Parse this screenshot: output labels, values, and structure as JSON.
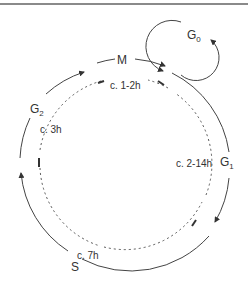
{
  "phases": {
    "m": {
      "label": "M"
    },
    "g1": {
      "label": "G",
      "sub": "1"
    },
    "s": {
      "label": "S"
    },
    "g2": {
      "label": "G",
      "sub": "2"
    },
    "g0": {
      "label": "G",
      "sub": "0"
    }
  },
  "durations": {
    "m": "c. 1-2h",
    "g1": "c. 2-14h",
    "s": "c. 7h",
    "g2": "c. 3h"
  },
  "colors": {
    "line": "#333333",
    "rule": "#8a8a8a",
    "background": "#ffffff"
  }
}
